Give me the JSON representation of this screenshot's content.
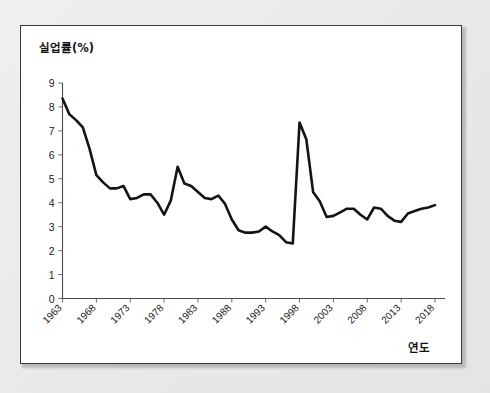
{
  "figure": {
    "panel_background": "#ffffff",
    "page_background": "#eaeaea",
    "border_color": "#3a3a3a",
    "series_color": "#141414",
    "axis_color": "#4a4a4a"
  },
  "chart_data": {
    "type": "line",
    "title": "",
    "subtitle": "",
    "ylabel": "실업률(%)",
    "xlabel": "연도",
    "grid": false,
    "legend": null,
    "legend_position": "none",
    "xlim": [
      1963,
      2018
    ],
    "ylim": [
      0,
      9
    ],
    "ytick_labels": [
      "9",
      "8",
      "7",
      "6",
      "5",
      "4",
      "3",
      "2",
      "1",
      "0"
    ],
    "ytick_values": [
      9,
      8,
      7,
      6,
      5,
      4,
      3,
      2,
      1,
      0
    ],
    "xtick_labels": [
      "1963",
      "1968",
      "1973",
      "1978",
      "1983",
      "1988",
      "1993",
      "1998",
      "2003",
      "2008",
      "2013",
      "2018"
    ],
    "xtick_values": [
      1963,
      1968,
      1973,
      1978,
      1983,
      1988,
      1993,
      1998,
      2003,
      2008,
      2013,
      2018
    ],
    "xtick_rotation": 45,
    "x": [
      1963,
      1964,
      1965,
      1966,
      1967,
      1968,
      1969,
      1970,
      1971,
      1972,
      1973,
      1974,
      1975,
      1976,
      1977,
      1978,
      1979,
      1980,
      1981,
      1982,
      1983,
      1984,
      1985,
      1986,
      1987,
      1988,
      1989,
      1990,
      1991,
      1992,
      1993,
      1994,
      1995,
      1996,
      1997,
      1998,
      1999,
      2000,
      2001,
      2002,
      2003,
      2004,
      2005,
      2006,
      2007,
      2008,
      2009,
      2010,
      2011,
      2012,
      2013,
      2014,
      2015,
      2016,
      2017,
      2018
    ],
    "values": [
      8.35,
      7.7,
      7.45,
      7.15,
      6.25,
      5.15,
      4.85,
      4.6,
      4.6,
      4.7,
      4.15,
      4.2,
      4.35,
      4.35,
      4.0,
      3.5,
      4.1,
      5.5,
      4.8,
      4.7,
      4.45,
      4.2,
      4.15,
      4.3,
      3.95,
      3.3,
      2.85,
      2.75,
      2.75,
      2.8,
      3.0,
      2.8,
      2.65,
      2.35,
      2.3,
      7.35,
      6.65,
      4.45,
      4.05,
      3.4,
      3.45,
      3.6,
      3.75,
      3.75,
      3.5,
      3.3,
      3.8,
      3.75,
      3.45,
      3.25,
      3.2,
      3.55,
      3.65,
      3.75,
      3.8,
      3.9
    ]
  }
}
